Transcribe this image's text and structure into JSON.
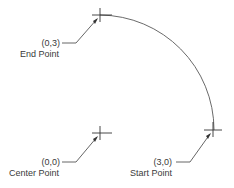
{
  "diagram": {
    "type": "arc-definition",
    "arc": {
      "description": "Quarter-circle arc from start point to end point about center point",
      "direction": "counterclockwise"
    },
    "points": [
      {
        "id": "end",
        "coord_label": "(0,3)",
        "name_label": "End Point"
      },
      {
        "id": "center",
        "coord_label": "(0,0)",
        "name_label": "Center Point"
      },
      {
        "id": "start",
        "coord_label": "(3,0)",
        "name_label": "Start Point"
      }
    ]
  }
}
